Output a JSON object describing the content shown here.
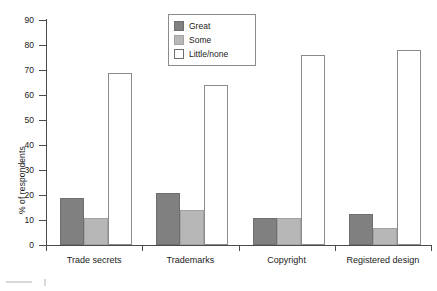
{
  "chart_data": {
    "type": "bar",
    "title": "",
    "xlabel": "",
    "ylabel": "% of respondents",
    "ylim": [
      0,
      90
    ],
    "ytick_step": 10,
    "yticks": [
      0,
      10,
      20,
      30,
      40,
      50,
      60,
      70,
      80,
      90
    ],
    "ytick_labels": [
      "0",
      "10",
      "20",
      "30",
      "40",
      "50",
      "60",
      "70",
      "80",
      "90"
    ],
    "grid": false,
    "legend_position": "top-center",
    "categories": [
      "Trade secrets",
      "Trademarks",
      "Copyright",
      "Registered design"
    ],
    "series": [
      {
        "name": "Great",
        "color": "#808080",
        "values": [
          19,
          21,
          11,
          12.5
        ]
      },
      {
        "name": "Some",
        "color": "#b7b7b7",
        "values": [
          11,
          14,
          11,
          7
        ]
      },
      {
        "name": "Little/none",
        "color": "#ffffff",
        "values": [
          69,
          64,
          76,
          78
        ]
      }
    ]
  },
  "legend": {
    "items": [
      {
        "label": "Great",
        "swatch": "dark-gray-swatch-icon"
      },
      {
        "label": "Some",
        "swatch": "light-gray-swatch-icon"
      },
      {
        "label": "Little/none",
        "swatch": "white-swatch-icon"
      }
    ]
  },
  "axes": {
    "y_title": "% of respondents",
    "y_labels": [
      "90",
      "80",
      "70",
      "60",
      "50",
      "40",
      "30",
      "20",
      "10",
      "0"
    ],
    "x_labels": [
      "Trade secrets",
      "Trademarks",
      "Copyright",
      "Registered design"
    ]
  }
}
